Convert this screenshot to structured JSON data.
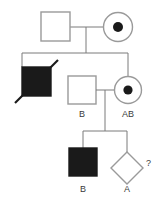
{
  "figure": {
    "kind": "pedigree-chart",
    "width": 168,
    "height": 201,
    "background_color": "#ffffff",
    "line_color": "#7a7a7a",
    "affected_fill_color": "#1a1a1a",
    "symbol_stroke_color": "#9a9a9a",
    "label_color": "#3a3a3a"
  },
  "generations": [
    {
      "id": "I",
      "individuals": [
        {
          "id": "I-1",
          "symbol": "square",
          "sex": "male",
          "status": "unaffected",
          "filled": false,
          "carrier_dot": false,
          "deceased": false,
          "label": ""
        },
        {
          "id": "I-2",
          "symbol": "circle",
          "sex": "female",
          "status": "carrier",
          "filled": false,
          "carrier_dot": true,
          "deceased": false,
          "label": ""
        }
      ]
    },
    {
      "id": "II",
      "individuals": [
        {
          "id": "II-1",
          "symbol": "square",
          "sex": "male",
          "status": "affected",
          "filled": true,
          "carrier_dot": false,
          "deceased": true,
          "label": ""
        },
        {
          "id": "II-2",
          "symbol": "square",
          "sex": "male",
          "status": "unaffected",
          "filled": false,
          "carrier_dot": false,
          "deceased": false,
          "label": "B"
        },
        {
          "id": "II-3",
          "symbol": "circle",
          "sex": "female",
          "status": "carrier",
          "filled": false,
          "carrier_dot": true,
          "deceased": false,
          "label": "AB"
        }
      ]
    },
    {
      "id": "III",
      "individuals": [
        {
          "id": "III-1",
          "symbol": "square",
          "sex": "male",
          "status": "affected",
          "filled": true,
          "carrier_dot": false,
          "deceased": false,
          "label": "B"
        },
        {
          "id": "III-2",
          "symbol": "diamond",
          "sex": "unknown",
          "status": "unaffected",
          "filled": false,
          "carrier_dot": false,
          "deceased": false,
          "label": "A",
          "annotation": "?"
        }
      ]
    }
  ],
  "labels": {
    "gen2_male_blood_type": "B",
    "gen2_female_blood_type": "AB",
    "gen3_male_blood_type": "B",
    "gen3_unknown_blood_type": "A",
    "gen3_unknown_question": "?"
  }
}
